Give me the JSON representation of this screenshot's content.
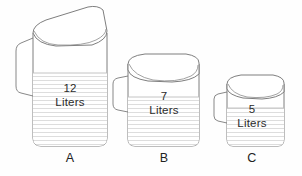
{
  "scene": {
    "title": "Three measuring pitchers",
    "background_color": "#fefefe",
    "outline_color": "#6f6f6f",
    "water_line_color": "#c9c9c9",
    "text_color": "#2b2b2b"
  },
  "pitchers": [
    {
      "id": "a",
      "caption": "A",
      "amount": "12",
      "unit": "Liters",
      "icon": "pitcher-icon"
    },
    {
      "id": "b",
      "caption": "B",
      "amount": "7",
      "unit": "Liters",
      "icon": "pitcher-icon"
    },
    {
      "id": "c",
      "caption": "C",
      "amount": "5",
      "unit": "Liters",
      "icon": "pitcher-icon"
    }
  ]
}
